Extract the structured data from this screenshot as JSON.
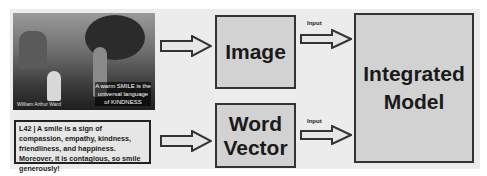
{
  "diagram": {
    "image_input": {
      "caption": "A warm SMILE is the universal language of KINDNESS",
      "signature": "William Arthur Ward"
    },
    "text_input": {
      "text": "L42 | A smile is a sign of compassion, empathy, kindness, friendliness, and happiness. Moreover, it is contagious, so smile generously!"
    },
    "nodes": {
      "image": "Image",
      "word_vector_line1": "Word",
      "word_vector_line2": "Vector",
      "model_line1": "Integrated",
      "model_line2": "Model"
    },
    "edges": {
      "image_to_model_label": "Input",
      "word_to_model_label": "Input"
    },
    "colors": {
      "panel": "#ececec",
      "box_fill": "#d2d2d2",
      "border": "#333333"
    }
  }
}
